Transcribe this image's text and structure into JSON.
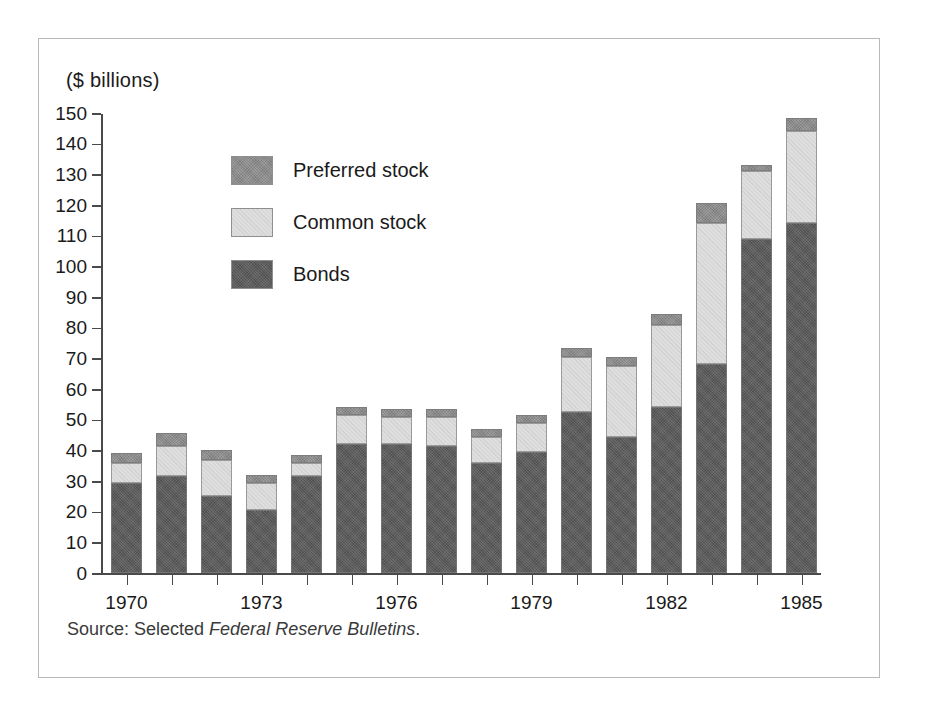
{
  "figure": {
    "axis_unit_caption": "($ billions)",
    "source_note_prefix": "Source: Selected ",
    "source_note_italic": "Federal Reserve Bulletins",
    "source_note_suffix": "."
  },
  "legend": {
    "items": [
      {
        "label": "Preferred stock",
        "swatch": "preferred-swatch",
        "color": "#8c8c8c"
      },
      {
        "label": "Common stock",
        "swatch": "common-swatch",
        "color": "#dedede"
      },
      {
        "label": "Bonds",
        "swatch": "bonds-swatch",
        "color": "#5c5c5c"
      }
    ]
  },
  "chart_data": {
    "type": "bar",
    "subtype": "stacked",
    "title": "",
    "xlabel": "",
    "ylabel": "($ billions)",
    "ylim": [
      0,
      150
    ],
    "ytick_step": 10,
    "yticks": [
      150,
      140,
      130,
      120,
      110,
      100,
      90,
      80,
      70,
      60,
      50,
      40,
      30,
      20,
      10,
      0
    ],
    "ytick_labels": [
      "150",
      "140",
      "130",
      "120",
      "110",
      "100",
      "90",
      "80",
      "70",
      "60",
      "50",
      "40",
      "30",
      "20",
      "10",
      "0"
    ],
    "grid": false,
    "legend_position": "upper-left-inside",
    "categories": [
      1970,
      1971,
      1972,
      1973,
      1974,
      1975,
      1976,
      1977,
      1978,
      1979,
      1980,
      1981,
      1982,
      1983,
      1984,
      1985
    ],
    "xtick_labels": [
      "1970",
      "",
      "",
      "1973",
      "",
      "",
      "1976",
      "",
      "",
      "1979",
      "",
      "",
      "1982",
      "",
      "",
      "1985"
    ],
    "series": [
      {
        "name": "Bonds",
        "color": "#5c5c5c",
        "values": [
          29.5,
          31.5,
          25.0,
          20.5,
          31.5,
          42.0,
          42.0,
          41.5,
          36.0,
          39.5,
          52.5,
          44.5,
          54.0,
          68.0,
          109.0,
          114.0
        ]
      },
      {
        "name": "Common stock",
        "color": "#dedede",
        "values": [
          6.5,
          10.0,
          12.0,
          9.0,
          4.5,
          9.5,
          9.0,
          9.5,
          8.5,
          9.5,
          18.0,
          23.0,
          27.0,
          46.0,
          22.0,
          30.0
        ]
      },
      {
        "name": "Preferred stock",
        "color": "#8c8c8c",
        "values": [
          3.0,
          4.0,
          3.0,
          2.5,
          2.5,
          2.5,
          2.5,
          2.5,
          2.5,
          2.5,
          3.0,
          3.0,
          3.5,
          6.5,
          2.0,
          4.5
        ]
      }
    ],
    "totals": [
      39.0,
      45.5,
      40.0,
      32.0,
      38.5,
      54.0,
      53.5,
      53.5,
      47.0,
      51.5,
      73.5,
      70.5,
      84.5,
      120.5,
      133.0,
      148.5
    ]
  }
}
